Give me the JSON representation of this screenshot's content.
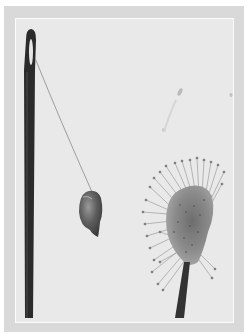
{
  "image": {
    "kind": "black-and-white photograph",
    "description": "A sewing needle with a thread holding a small hanging object beside a sundew plant leaf with glandular tentacles",
    "subjects": [
      "needle",
      "thread",
      "hanging-object",
      "sundew-leaf",
      "sundew-stalk"
    ],
    "colors": {
      "outer_mat": "#d9d9d9",
      "plate_background": "#e9e9e9",
      "inner_border": "#fbfbfb",
      "needle": "#2b2b2b",
      "thread": "#8a8a8a",
      "object": "#5a5a5a",
      "plant_head": "#7a7a7a",
      "plant_stalk": "#333333"
    }
  }
}
